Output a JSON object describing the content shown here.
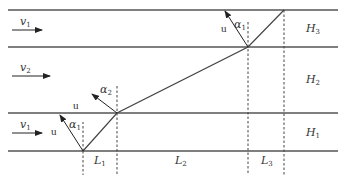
{
  "diagram": {
    "title": "",
    "colors": {
      "line": "#555555",
      "text": "#333333",
      "background": "#ffffff"
    },
    "boundaries_y": [
      10,
      47,
      113,
      151
    ],
    "layers": [
      {
        "name": "H3",
        "label": "H",
        "sub": "3",
        "flow_label": "v",
        "flow_sub": "1"
      },
      {
        "name": "H2",
        "label": "H",
        "sub": "2",
        "flow_label": "v",
        "flow_sub": "2"
      },
      {
        "name": "H1",
        "label": "H",
        "sub": "1",
        "flow_label": "v",
        "flow_sub": "1"
      }
    ],
    "path_points": [
      {
        "id": "A",
        "x": 83,
        "y": 151
      },
      {
        "id": "B",
        "x": 117,
        "y": 113
      },
      {
        "id": "C",
        "x": 248,
        "y": 47
      },
      {
        "id": "D",
        "x": 284,
        "y": 10
      }
    ],
    "distances": [
      {
        "label": "L",
        "sub": "1"
      },
      {
        "label": "L",
        "sub": "2"
      },
      {
        "label": "L",
        "sub": "3"
      }
    ],
    "velocity_vectors": [
      {
        "label": "u",
        "angle_label": "α",
        "angle_sub": "1"
      },
      {
        "label": "u",
        "angle_label": "α",
        "angle_sub": "2"
      },
      {
        "label": "u",
        "angle_label": "α",
        "angle_sub": "1"
      }
    ]
  }
}
